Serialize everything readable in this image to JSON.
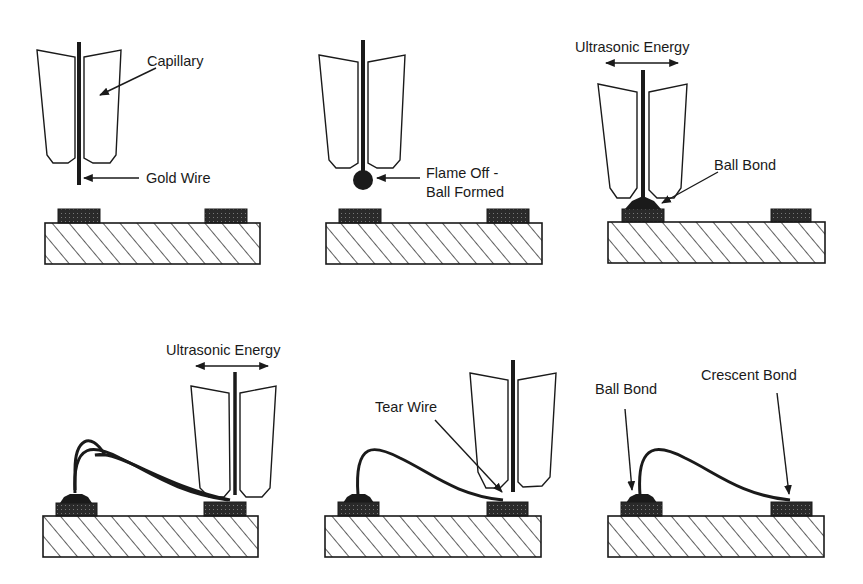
{
  "figure": {
    "type": "wire-bonding-process-sequence",
    "panels": [
      {
        "id": 1,
        "labels": {
          "capillary": "Capillary",
          "wire": "Gold Wire"
        }
      },
      {
        "id": 2,
        "labels": {
          "ball_line1": "Flame Off -",
          "ball_line2": "Ball Formed"
        }
      },
      {
        "id": 3,
        "labels": {
          "energy": "Ultrasonic Energy",
          "ball_bond": "Ball Bond"
        }
      },
      {
        "id": 4,
        "labels": {
          "energy": "Ultrasonic Energy"
        }
      },
      {
        "id": 5,
        "labels": {
          "tear": "Tear Wire"
        }
      },
      {
        "id": 6,
        "labels": {
          "ball_bond": "Ball Bond",
          "crescent_bond": "Crescent Bond"
        }
      }
    ]
  },
  "colors": {
    "ink": "#1a1a1a",
    "background": "#ffffff",
    "pad": "#2a2a2a"
  }
}
